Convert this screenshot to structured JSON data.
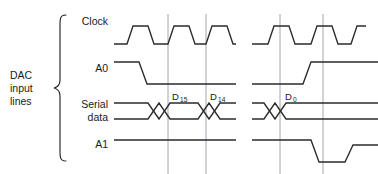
{
  "figure": {
    "type": "timing-diagram",
    "title_group": {
      "lines": [
        "DAC",
        "input",
        "lines"
      ],
      "line1": "DAC",
      "line2": "input",
      "line3": "lines"
    },
    "signals": [
      {
        "id": "clock",
        "label": "Clock",
        "kind": "clock",
        "baseline_y": 30,
        "label_y": 24
      },
      {
        "id": "a0",
        "label": "A0",
        "kind": "level",
        "baseline_y": 72,
        "label_y": 72
      },
      {
        "id": "serial",
        "label_line1": "Serial",
        "label_line2": "data",
        "kind": "bus",
        "baseline_y": 112,
        "label_y": 108
      },
      {
        "id": "a1",
        "label": "A1",
        "kind": "level",
        "baseline_y": 148,
        "label_y": 148
      }
    ],
    "bit_labels": [
      {
        "name": "D15",
        "base": "D",
        "sub": "15",
        "x": 172,
        "y": 100
      },
      {
        "name": "D14",
        "base": "D",
        "sub": "14",
        "x": 210,
        "y": 100
      },
      {
        "name": "D0",
        "base": "D",
        "sub": "0",
        "x": 285,
        "y": 100
      }
    ],
    "gridlines_x": [
      168,
      206,
      280,
      323
    ],
    "break_gap": {
      "start": 236,
      "end": 252
    },
    "colors": {
      "waveform": "#2b2b2b",
      "gridline": "#9a9aa8",
      "text": "#1a1a1a",
      "background": "#ffffff"
    },
    "paths": {
      "clock": "M 114,44 L 127,44 L 133,26 L 148,26 L 154,44 L 168,44 L 174,26 L 189,26 L 195,44 L 206,44 L 212,26 L 227,26 L 233,44 L 236,44 M 252,44 L 268,44 L 274,26 L 289,26 L 295,44 L 311,44 L 317,26 L 332,26 L 338,44 L 351,44 L 357,26 L 366,26",
      "a0": "M 114,62 L 139,62 L 147,84 L 236,84 M 252,84 L 303,84 L 311,62 L 378,62",
      "serial_top": "M 114,103 L 148,103 L 159,119 L 170,103 L 198,103 L 209,119 L 220,103 L 236,103 M 252,103 L 264,103 L 275,119 L 286,103 L 378,103",
      "serial_bot": "M 114,119 L 148,119 L 159,103 L 170,119 L 198,119 L 209,103 L 220,119 L 236,119 M 252,119 L 264,119 L 275,103 L 286,119 L 378,119",
      "a1": "M 114,140 L 236,140 M 252,140 L 311,140 L 319,162 L 345,162 L 353,145 L 378,145"
    }
  }
}
